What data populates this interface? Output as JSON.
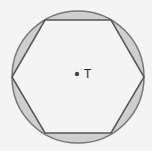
{
  "diagram": {
    "circle": {
      "cx": 78,
      "cy": 77,
      "r": 66,
      "fill": "#cfcfcf",
      "stroke": "#777777"
    },
    "hexagon": {
      "points": "12,77 45,20 111,20 144,77 111,133 45,133",
      "fill": "#f4f4f4",
      "stroke": "#555555"
    },
    "center_point": {
      "cx": 77,
      "cy": 74,
      "r": 2.2,
      "fill": "#444444"
    },
    "center_label": "T"
  }
}
